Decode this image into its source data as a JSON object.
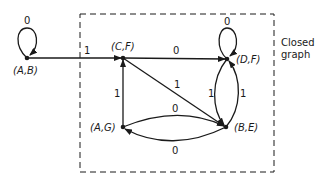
{
  "diagram": {
    "type": "state-graph",
    "enclosure_label_line1": "Closed",
    "enclosure_label_line2": "graph",
    "nodes": [
      {
        "id": "AB",
        "label": "(A,B)"
      },
      {
        "id": "CF",
        "label": "(C,F)"
      },
      {
        "id": "DF",
        "label": "(D,F)"
      },
      {
        "id": "BE",
        "label": "(B,E)"
      },
      {
        "id": "AG",
        "label": "(A,G)"
      }
    ],
    "edges": [
      {
        "from": "AB",
        "to": "AB",
        "label": "0"
      },
      {
        "from": "AB",
        "to": "CF",
        "label": "1"
      },
      {
        "from": "CF",
        "to": "DF",
        "label": "0"
      },
      {
        "from": "CF",
        "to": "BE",
        "label": "1"
      },
      {
        "from": "DF",
        "to": "DF",
        "label": "0"
      },
      {
        "from": "DF",
        "to": "BE",
        "label": "1"
      },
      {
        "from": "BE",
        "to": "DF",
        "label": "1"
      },
      {
        "from": "AG",
        "to": "CF",
        "label": "1"
      },
      {
        "from": "AG",
        "to": "BE",
        "label": "0"
      },
      {
        "from": "BE",
        "to": "AG",
        "label": "0"
      }
    ]
  }
}
